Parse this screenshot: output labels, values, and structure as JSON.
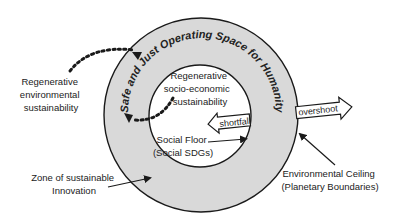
{
  "diagram": {
    "type": "doughnut-ring",
    "colors": {
      "background": "#ffffff",
      "ring_fill": "#d9d9d9",
      "inner_fill": "#ffffff",
      "stroke": "#1a1a1a",
      "text": "#222222"
    },
    "ring_label": "Safe and Just Operating Space for Humanity",
    "inner_labels": {
      "regenerative_socio": [
        "Regenerative",
        "socio-economic",
        "sustainability"
      ],
      "social_floor": [
        "Social Floor",
        "(Social SDGs)"
      ]
    },
    "arrows": {
      "shortfall": "shortfall",
      "overshoot": "overshoot"
    },
    "outer_labels": {
      "regenerative_env": [
        "Regenerative",
        "environmental",
        "sustainability"
      ],
      "zone_innovation": [
        "Zone of sustainable",
        "Innovation"
      ],
      "env_ceiling": [
        "Environmental Ceiling",
        "(Planetary Boundaries)"
      ]
    }
  }
}
